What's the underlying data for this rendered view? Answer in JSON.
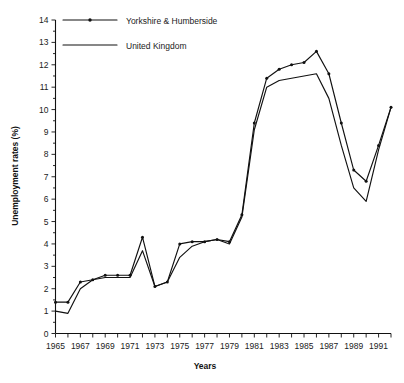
{
  "chart_data": {
    "type": "line",
    "title": "",
    "xlabel": "Years",
    "ylabel": "Unemployment rates (%)",
    "xlim": [
      1965,
      1992
    ],
    "ylim": [
      0,
      14
    ],
    "grid": false,
    "legend_position": "top-left",
    "y_ticks": [
      0,
      1,
      2,
      3,
      4,
      5,
      6,
      7,
      8,
      9,
      10,
      11,
      12,
      13,
      14
    ],
    "y_tick_labels": [
      "0",
      "1",
      "2",
      "3",
      "4",
      "5",
      "6",
      "7",
      "8",
      "9",
      "10",
      "11",
      "12",
      "13",
      "14"
    ],
    "y_minor_tick_step": 0.5,
    "x_ticks": [
      1965,
      1966,
      1967,
      1968,
      1969,
      1970,
      1971,
      1972,
      1973,
      1974,
      1975,
      1976,
      1977,
      1978,
      1979,
      1980,
      1981,
      1982,
      1983,
      1984,
      1985,
      1986,
      1987,
      1988,
      1989,
      1990,
      1991,
      1992
    ],
    "x_tick_labels_shown": [
      "1965",
      "1967",
      "1969",
      "1971",
      "1973",
      "1975",
      "1977",
      "1979",
      "1981",
      "1983",
      "1985",
      "1987",
      "1989",
      "1991"
    ],
    "x": [
      1965,
      1966,
      1967,
      1968,
      1969,
      1970,
      1971,
      1972,
      1973,
      1974,
      1975,
      1976,
      1977,
      1978,
      1979,
      1980,
      1981,
      1982,
      1983,
      1984,
      1985,
      1986,
      1987,
      1988,
      1989,
      1990,
      1991,
      1992
    ],
    "series": [
      {
        "name": "Yorkshire & Humberside",
        "marker": "dot",
        "values": [
          1.4,
          1.4,
          2.3,
          2.4,
          2.6,
          2.6,
          2.6,
          4.3,
          2.1,
          2.3,
          4.0,
          4.1,
          4.1,
          4.2,
          4.1,
          5.3,
          9.4,
          11.4,
          11.8,
          12.0,
          12.1,
          12.6,
          11.6,
          9.4,
          7.3,
          6.8,
          8.4,
          10.1
        ]
      },
      {
        "name": "United Kingdom",
        "marker": "none",
        "values": [
          1.0,
          0.9,
          2.0,
          2.4,
          2.5,
          2.5,
          2.5,
          3.7,
          2.1,
          2.3,
          3.4,
          3.9,
          4.1,
          4.2,
          4.0,
          5.2,
          9.1,
          11.0,
          11.3,
          11.4,
          11.5,
          11.6,
          10.5,
          8.4,
          6.5,
          5.9,
          8.2,
          10.1
        ]
      }
    ]
  },
  "legend": {
    "entries": [
      {
        "label": "Yorkshire & Humberside",
        "style": "line-with-marker"
      },
      {
        "label": "United Kingdom",
        "style": "line"
      }
    ]
  },
  "axes": {
    "y_title": "Unemployment rates (%)",
    "x_title": "Years"
  },
  "colors": {
    "line": "#111111",
    "text": "#222222",
    "background": "#ffffff"
  }
}
